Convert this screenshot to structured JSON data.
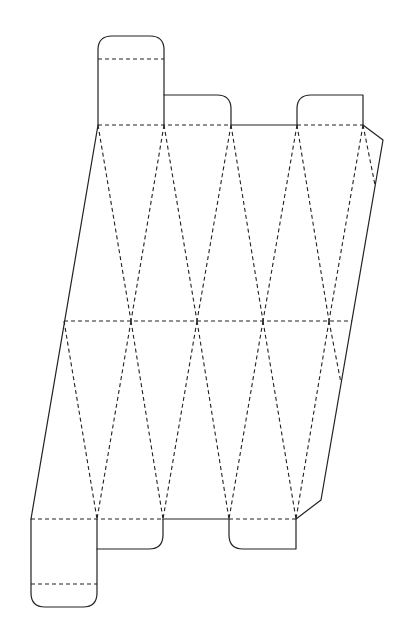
{
  "diagram": {
    "type": "die-cut fold template",
    "canvas": {
      "width": 407,
      "height": 625,
      "background": "#ffffff"
    },
    "stroke_color": "#222222",
    "cut_paths": [
      {
        "name": "top-left-tab",
        "d": "M98,125 L98,50 Q98,36 112,36 L150,36 Q164,36 164,50 L164,125"
      },
      {
        "name": "top-middle-flap",
        "d": "M164,95 L217,95 Q231,95 231,109 L231,125"
      },
      {
        "name": "top-solid-edge",
        "d": "M231,125 L297,125"
      },
      {
        "name": "top-right-tab",
        "d": "M297,125 L297,109 Q297,95 311,95 L363,95 L363,125"
      },
      {
        "name": "top-right-chamfer-and-right-edge",
        "d": "M363,125 L383,140 L321,500 L296,519"
      },
      {
        "name": "left-edge",
        "d": "M98,125 L31,519"
      },
      {
        "name": "bottom-left-tab",
        "d": "M31,519 L31,593 Q31,607 45,607 L83,607 Q97,607 97,593 L97,519"
      },
      {
        "name": "bottom-middle-tab-1",
        "d": "M97,549 L149,549 Q163,549 163,535 L163,519"
      },
      {
        "name": "bottom-solid-edge",
        "d": "M163,519 L229,519"
      },
      {
        "name": "bottom-middle-tab-2",
        "d": "M229,519 L229,535 Q229,549 243,549 L296,549 L296,519"
      }
    ],
    "fold_lines": [
      {
        "name": "top-left-tab-fold",
        "x1": 98,
        "y1": 59,
        "x2": 164,
        "y2": 59
      },
      {
        "name": "top-fold-a",
        "x1": 98,
        "y1": 125,
        "x2": 231,
        "y2": 125
      },
      {
        "name": "top-fold-b",
        "x1": 297,
        "y1": 125,
        "x2": 363,
        "y2": 125
      },
      {
        "name": "middle-fold",
        "x1": 64,
        "y1": 321,
        "x2": 352,
        "y2": 321
      },
      {
        "name": "bottom-fold-a",
        "x1": 31,
        "y1": 519,
        "x2": 163,
        "y2": 519
      },
      {
        "name": "bottom-fold-b",
        "x1": 229,
        "y1": 519,
        "x2": 296,
        "y2": 519
      },
      {
        "name": "bottom-left-tab-fold",
        "x1": 31,
        "y1": 584,
        "x2": 97,
        "y2": 584
      },
      {
        "name": "upper-diag-1",
        "x1": 98,
        "y1": 125,
        "x2": 131,
        "y2": 321
      },
      {
        "name": "upper-diag-2",
        "x1": 164,
        "y1": 125,
        "x2": 131,
        "y2": 321
      },
      {
        "name": "upper-diag-3",
        "x1": 164,
        "y1": 125,
        "x2": 197,
        "y2": 321
      },
      {
        "name": "upper-diag-4",
        "x1": 231,
        "y1": 125,
        "x2": 197,
        "y2": 321
      },
      {
        "name": "upper-diag-5",
        "x1": 231,
        "y1": 125,
        "x2": 263,
        "y2": 321
      },
      {
        "name": "upper-diag-6",
        "x1": 297,
        "y1": 125,
        "x2": 263,
        "y2": 321
      },
      {
        "name": "upper-diag-7",
        "x1": 297,
        "y1": 125,
        "x2": 329,
        "y2": 321
      },
      {
        "name": "upper-diag-8",
        "x1": 363,
        "y1": 125,
        "x2": 329,
        "y2": 321
      },
      {
        "name": "upper-diag-9",
        "x1": 363,
        "y1": 125,
        "x2": 375,
        "y2": 185
      },
      {
        "name": "lower-diag-1",
        "x1": 64,
        "y1": 321,
        "x2": 97,
        "y2": 519
      },
      {
        "name": "lower-diag-2",
        "x1": 131,
        "y1": 321,
        "x2": 97,
        "y2": 519
      },
      {
        "name": "lower-diag-3",
        "x1": 131,
        "y1": 321,
        "x2": 163,
        "y2": 519
      },
      {
        "name": "lower-diag-4",
        "x1": 197,
        "y1": 321,
        "x2": 163,
        "y2": 519
      },
      {
        "name": "lower-diag-5",
        "x1": 197,
        "y1": 321,
        "x2": 229,
        "y2": 519
      },
      {
        "name": "lower-diag-6",
        "x1": 263,
        "y1": 321,
        "x2": 229,
        "y2": 519
      },
      {
        "name": "lower-diag-7",
        "x1": 263,
        "y1": 321,
        "x2": 296,
        "y2": 519
      },
      {
        "name": "lower-diag-8",
        "x1": 329,
        "y1": 321,
        "x2": 296,
        "y2": 519
      },
      {
        "name": "lower-diag-9",
        "x1": 329,
        "y1": 321,
        "x2": 341,
        "y2": 383
      }
    ]
  }
}
